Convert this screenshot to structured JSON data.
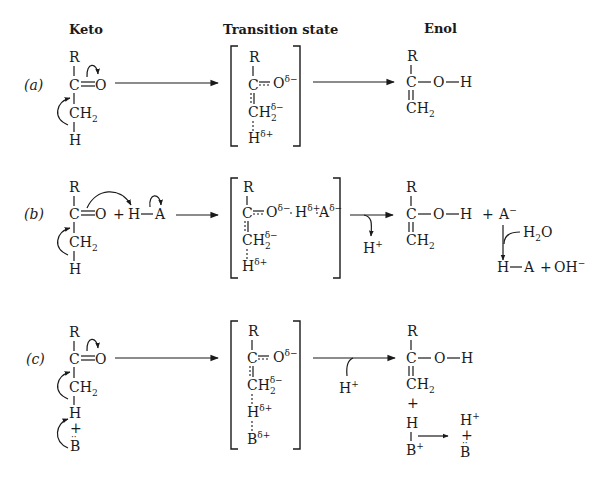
{
  "headers": {
    "keto": "Keto",
    "transition": "Transition state",
    "enol": "Enol"
  },
  "rows": [
    {
      "label": "(a)",
      "keto": {
        "R": "R",
        "C": "C",
        "O": "O",
        "CH": "CH",
        "sub2": "2",
        "H": "H"
      },
      "ts": {
        "R": "R",
        "C": "C",
        "O": "O",
        "O_charge": "δ−",
        "CH": "CH",
        "CH_sub": "2",
        "CH_charge": "δ−",
        "H": "H",
        "H_charge": "δ+"
      },
      "enol": {
        "R": "R",
        "C": "C",
        "O": "O",
        "H": "H",
        "CH": "CH",
        "sub2": "2"
      }
    },
    {
      "label": "(b)",
      "keto": {
        "R": "R",
        "C": "C",
        "O": "O",
        "plus": "+",
        "HA_H": "H",
        "HA_A": "A",
        "CH": "CH",
        "sub2": "2",
        "H": "H"
      },
      "ts": {
        "R": "R",
        "C": "C",
        "O": "O",
        "O_charge": "δ−",
        "H2": "H",
        "H2_charge": "δ+",
        "A": "A",
        "A_charge": "δ−",
        "CH": "CH",
        "CH_sub": "2",
        "CH_charge": "δ−",
        "H": "H",
        "H_charge": "δ+"
      },
      "released": {
        "H": "H",
        "charge": "+"
      },
      "enol": {
        "R": "R",
        "C": "C",
        "O": "O",
        "H": "H",
        "CH": "CH",
        "sub2": "2",
        "plus": "+",
        "A": "A",
        "A_charge": "−"
      },
      "water": {
        "H2O_H": "H",
        "H2O_sub": "2",
        "H2O_O": "O",
        "HA_H": "H",
        "HA_A": "A",
        "plus": "+",
        "OH": "OH",
        "OH_charge": "−"
      }
    },
    {
      "label": "(c)",
      "keto": {
        "R": "R",
        "C": "C",
        "O": "O",
        "CH": "CH",
        "sub2": "2",
        "H": "H",
        "plus": "+",
        "B": "B",
        "lonepair": "··"
      },
      "ts": {
        "R": "R",
        "C": "C",
        "O": "O",
        "O_charge": "δ−",
        "CH": "CH",
        "CH_sub": "2",
        "CH_charge": "δ−",
        "H": "H",
        "H_charge": "δ+",
        "B": "B",
        "B_charge": "δ+"
      },
      "added": {
        "H": "H",
        "charge": "+"
      },
      "enol": {
        "R": "R",
        "C": "C",
        "O": "O",
        "H": "H",
        "CH": "CH",
        "sub2": "2",
        "plus": "+"
      },
      "base": {
        "H": "H",
        "B": "B",
        "B_charge": "+",
        "prod_H": "H",
        "prod_H_charge": "+",
        "prod_plus": "+",
        "prod_B": "B",
        "lonepair": "··"
      }
    }
  ]
}
